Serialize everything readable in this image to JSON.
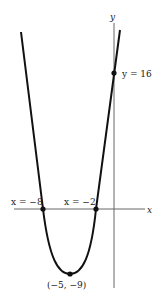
{
  "graph": {
    "function": "y = x^2 + 10x + 16",
    "axes": {
      "x_label": "x",
      "y_label": "y"
    },
    "points": {
      "y_intercept": {
        "x": 0,
        "y": 16,
        "label": "y = 16"
      },
      "root_left": {
        "x": -8,
        "y": 0,
        "label": "x = −8"
      },
      "root_right": {
        "x": -2,
        "y": 0,
        "label": "x = −2"
      },
      "vertex": {
        "x": -5,
        "y": -9,
        "label": "(−5, −9)"
      }
    },
    "colors": {
      "curve": "#111111",
      "axis": "#555555",
      "text": "#222222"
    }
  }
}
